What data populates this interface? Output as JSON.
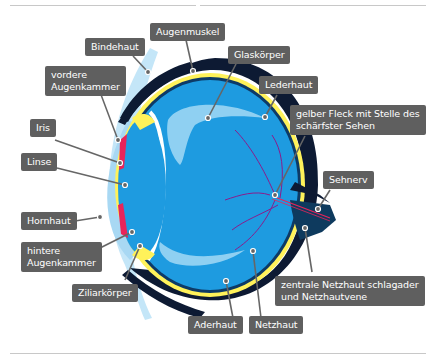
{
  "diagram": {
    "type": "anatomy-eye-cross-section",
    "language": "de",
    "colors": {
      "label_bg": "#5f5f5f",
      "label_text": "#ffffff",
      "leader_line": "#666666",
      "vitreous": "#1e9be0",
      "vitreous_light": "#8fd0f2",
      "cornea": "#c4e6f8",
      "sclera_dark": "#0d1a33",
      "choroid_yellow": "#fff25a",
      "iris": "#e8245a",
      "vessel": "#8a1c8c",
      "optic_nerve": "#0e3a5e"
    },
    "labels": {
      "augenmuskel": "Augenmuskel",
      "bindehaut": "Bindehaut",
      "glaskoerper": "Glaskörper",
      "vordere_augenkammer_1": "vordere",
      "vordere_augenkammer_2": "Augenkammer",
      "lederhaut": "Lederhaut",
      "iris": "Iris",
      "gelber_fleck_1": "gelber Fleck mit Stelle des",
      "gelber_fleck_2": "schärfster Sehen",
      "linse": "Linse",
      "sehnerv": "Sehnerv",
      "hornhaut": "Hornhaut",
      "hintere_augenkammer_1": "hintere",
      "hintere_augenkammer_2": "Augenkammer",
      "ziliarkoerper": "Ziliarkörper",
      "zentrale_1": "zentrale Netzhaut schlagader",
      "zentrale_2": "und Netzhautvene",
      "aderhaut": "Aderhaut",
      "netzhaut": "Netzhaut"
    }
  }
}
